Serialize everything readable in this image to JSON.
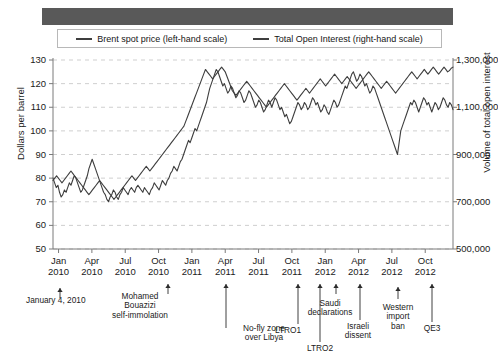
{
  "figure": {
    "header_bar_color": "#595959",
    "background": "#ffffff",
    "line_color": "#3e3e3e",
    "grid_color": "#cfcfcf",
    "axis_color": "#7a7a7a"
  },
  "legend": {
    "entries": [
      {
        "label": "Brent spot price (left-hand scale)",
        "swatch": "line-swatch"
      },
      {
        "label": "Total Open Interest (right-hand scale)",
        "swatch": "line-swatch"
      }
    ]
  },
  "axes": {
    "left": {
      "title": "Dollars per barrel",
      "ticks": [
        "130",
        "120",
        "110",
        "100",
        "90",
        "80",
        "70",
        "60",
        "50"
      ],
      "min": 50,
      "max": 130
    },
    "right": {
      "title": "Volume of total open interest",
      "ticks": [
        "1,300,000",
        "1,100,000",
        "900,000",
        "700,000",
        "500,000"
      ],
      "min": 500000,
      "max": 1300000
    },
    "x": {
      "ticks": [
        {
          "month": "Jan",
          "year": "2010"
        },
        {
          "month": "Apr",
          "year": "2010"
        },
        {
          "month": "Jul",
          "year": "2010"
        },
        {
          "month": "Oct",
          "year": "2010"
        },
        {
          "month": "Jan",
          "year": "2011"
        },
        {
          "month": "Apr",
          "year": "2011"
        },
        {
          "month": "Jul",
          "year": "2011"
        },
        {
          "month": "Oct",
          "year": "2011"
        },
        {
          "month": "Jan",
          "year": "2012"
        },
        {
          "month": "Apr",
          "year": "2012"
        },
        {
          "month": "Jul",
          "year": "2012"
        },
        {
          "month": "Oct",
          "year": "2012"
        }
      ]
    }
  },
  "annotations": [
    {
      "id": "jan-4-2010",
      "label": "January 4, 2010"
    },
    {
      "id": "mohamed-bouazizi",
      "label": "Mohamed\nBouazizi\nself-immolation"
    },
    {
      "id": "no-fly-zone",
      "label": "No-fly zone\nover Libya"
    },
    {
      "id": "ltro1",
      "label": "LTRO1"
    },
    {
      "id": "ltro2",
      "label": "LTRO2"
    },
    {
      "id": "saudi-declarations",
      "label": "Saudi\ndeclarations"
    },
    {
      "id": "israeli-dissent",
      "label": "Israeli\ndissent"
    },
    {
      "id": "western-import-ban",
      "label": "Western\nimport\nban"
    },
    {
      "id": "qe3",
      "label": "QE3"
    }
  ],
  "chart_data": {
    "type": "line",
    "title": "",
    "xlabel": "",
    "ylabel": "Dollars per barrel",
    "y2label": "Volume of total open interest",
    "ylim": [
      50,
      130
    ],
    "y2lim": [
      500000,
      1300000
    ],
    "grid": true,
    "legend_position": "top",
    "x_start": "2010-01",
    "x_end": "2012-12",
    "x_tick_labels": [
      "Jan 2010",
      "Apr 2010",
      "Jul 2010",
      "Oct 2010",
      "Jan 2011",
      "Apr 2011",
      "Jul 2011",
      "Oct 2011",
      "Jan 2012",
      "Apr 2012",
      "Jul 2012",
      "Oct 2012"
    ],
    "series": [
      {
        "name": "Brent spot price (left-hand scale)",
        "axis": "left",
        "units": "USD per barrel",
        "values": [
          80,
          78,
          76,
          77,
          74,
          72,
          73,
          75,
          74,
          76,
          78,
          77,
          79,
          81,
          80,
          78,
          76,
          74,
          75,
          77,
          79,
          81,
          84,
          86,
          88,
          86,
          84,
          82,
          80,
          78,
          76,
          74,
          73,
          71,
          70,
          72,
          73,
          75,
          74,
          72,
          71,
          73,
          74,
          76,
          75,
          74,
          73,
          75,
          76,
          75,
          74,
          76,
          77,
          76,
          75,
          74,
          76,
          75,
          74,
          73,
          75,
          76,
          78,
          77,
          76,
          75,
          77,
          79,
          78,
          77,
          79,
          80,
          82,
          83,
          85,
          84,
          83,
          85,
          87,
          88,
          90,
          92,
          94,
          96,
          95,
          97,
          99,
          101,
          100,
          102,
          104,
          106,
          108,
          110,
          112,
          115,
          118,
          120,
          122,
          124,
          126,
          125,
          123,
          121,
          119,
          120,
          118,
          116,
          117,
          119,
          118,
          116,
          114,
          115,
          117,
          116,
          114,
          112,
          113,
          115,
          117,
          116,
          114,
          112,
          110,
          111,
          113,
          112,
          110,
          108,
          109,
          111,
          113,
          112,
          110,
          112,
          114,
          113,
          111,
          109,
          110,
          108,
          106,
          107,
          105,
          103,
          104,
          106,
          108,
          110,
          112,
          111,
          109,
          110,
          112,
          111,
          109,
          110,
          112,
          114,
          113,
          111,
          112,
          110,
          108,
          109,
          111,
          110,
          108,
          107,
          109,
          111,
          113,
          112,
          110,
          111,
          113,
          115,
          117,
          119,
          118,
          120,
          122,
          124,
          125,
          123,
          121,
          122,
          124,
          123,
          121,
          119,
          120,
          118,
          116,
          117,
          119,
          118,
          116,
          114,
          112,
          110,
          108,
          106,
          104,
          102,
          100,
          98,
          96,
          94,
          92,
          90,
          95,
          100,
          102,
          104,
          106,
          108,
          110,
          112,
          111,
          113,
          112,
          110,
          108,
          110,
          112,
          114,
          113,
          111,
          112,
          110,
          108,
          110,
          112,
          111,
          109,
          110,
          112,
          114,
          113,
          111,
          110,
          112,
          111,
          109
        ]
      },
      {
        "name": "Total Open Interest (right-hand scale)",
        "axis": "right",
        "units": "contracts",
        "values": [
          790000,
          800000,
          810000,
          800000,
          790000,
          780000,
          790000,
          800000,
          810000,
          820000,
          830000,
          820000,
          810000,
          800000,
          790000,
          780000,
          770000,
          760000,
          750000,
          740000,
          730000,
          740000,
          750000,
          760000,
          770000,
          780000,
          790000,
          780000,
          770000,
          760000,
          750000,
          740000,
          730000,
          720000,
          710000,
          720000,
          730000,
          740000,
          750000,
          760000,
          770000,
          780000,
          790000,
          800000,
          810000,
          800000,
          790000,
          800000,
          810000,
          820000,
          830000,
          840000,
          850000,
          840000,
          830000,
          840000,
          850000,
          860000,
          870000,
          880000,
          890000,
          900000,
          910000,
          920000,
          930000,
          940000,
          950000,
          960000,
          970000,
          980000,
          990000,
          1000000,
          1010000,
          1020000,
          1040000,
          1060000,
          1080000,
          1100000,
          1120000,
          1140000,
          1160000,
          1180000,
          1200000,
          1220000,
          1240000,
          1260000,
          1250000,
          1240000,
          1230000,
          1220000,
          1230000,
          1240000,
          1250000,
          1260000,
          1270000,
          1260000,
          1250000,
          1230000,
          1210000,
          1190000,
          1170000,
          1160000,
          1150000,
          1160000,
          1170000,
          1180000,
          1190000,
          1200000,
          1210000,
          1200000,
          1190000,
          1180000,
          1170000,
          1160000,
          1150000,
          1140000,
          1130000,
          1120000,
          1110000,
          1100000,
          1110000,
          1120000,
          1130000,
          1140000,
          1150000,
          1160000,
          1170000,
          1180000,
          1190000,
          1200000,
          1190000,
          1180000,
          1170000,
          1160000,
          1150000,
          1140000,
          1130000,
          1140000,
          1150000,
          1160000,
          1170000,
          1180000,
          1170000,
          1160000,
          1170000,
          1180000,
          1190000,
          1200000,
          1210000,
          1220000,
          1210000,
          1200000,
          1190000,
          1200000,
          1210000,
          1220000,
          1230000,
          1240000,
          1230000,
          1220000,
          1210000,
          1200000,
          1210000,
          1220000,
          1230000,
          1220000,
          1210000,
          1200000,
          1190000,
          1180000,
          1190000,
          1200000,
          1210000,
          1220000,
          1230000,
          1240000,
          1250000,
          1240000,
          1230000,
          1220000,
          1210000,
          1200000,
          1190000,
          1180000,
          1190000,
          1200000,
          1210000,
          1200000,
          1190000,
          1180000,
          1170000,
          1160000,
          1170000,
          1180000,
          1190000,
          1200000,
          1210000,
          1220000,
          1230000,
          1240000,
          1250000,
          1240000,
          1230000,
          1220000,
          1230000,
          1240000,
          1250000,
          1260000,
          1250000,
          1240000,
          1250000,
          1260000,
          1270000,
          1260000,
          1250000,
          1240000,
          1250000,
          1260000,
          1270000,
          1260000,
          1250000,
          1255000,
          1265000,
          1270000
        ]
      }
    ],
    "event_markers": [
      {
        "label": "January 4, 2010",
        "x": "2010-01-04"
      },
      {
        "label": "Mohamed Bouazizi self-immolation",
        "x": "2010-12-17"
      },
      {
        "label": "No-fly zone over Libya",
        "x": "2011-03-19"
      },
      {
        "label": "LTRO1",
        "x": "2011-12-21"
      },
      {
        "label": "LTRO2",
        "x": "2012-02-29"
      },
      {
        "label": "Saudi declarations",
        "x": "2012-03-20"
      },
      {
        "label": "Israeli dissent",
        "x": "2012-04-25"
      },
      {
        "label": "Western import ban",
        "x": "2012-07-01"
      },
      {
        "label": "QE3",
        "x": "2012-09-13"
      }
    ]
  }
}
